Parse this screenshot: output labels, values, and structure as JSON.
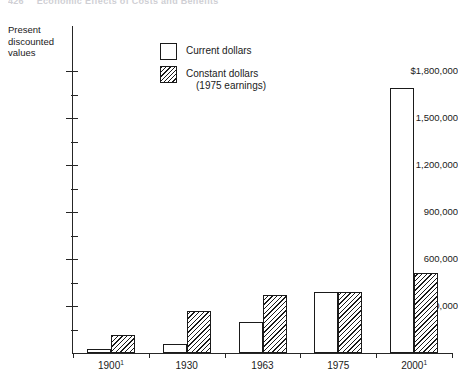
{
  "running_head": {
    "page_number": "426",
    "title": "Economic Effects of Costs and Benefits"
  },
  "chart_data": {
    "type": "bar",
    "title": "",
    "ylabel": "Present discounted values",
    "xlabel": "",
    "ylim": [
      0,
      1890000
    ],
    "grid": false,
    "legend_position": "inside-top-left",
    "y_axis_caption_lines": [
      "Present",
      "discounted",
      "values"
    ],
    "categories": [
      "1900",
      "1930",
      "1963",
      "1975",
      "2000"
    ],
    "category_labels": [
      {
        "text": "1900",
        "footnote": "1"
      },
      {
        "text": "1930",
        "footnote": ""
      },
      {
        "text": "1963",
        "footnote": ""
      },
      {
        "text": "1975",
        "footnote": ""
      },
      {
        "text": "2000",
        "footnote": "1"
      }
    ],
    "y_ticks": [
      {
        "value": 1800000,
        "label": "$1,800,000",
        "major": true
      },
      {
        "value": 1650000,
        "label": "",
        "major": false
      },
      {
        "value": 1500000,
        "label": "1,500,000",
        "major": true
      },
      {
        "value": 1350000,
        "label": "",
        "major": false
      },
      {
        "value": 1200000,
        "label": "1,200,000",
        "major": true
      },
      {
        "value": 1050000,
        "label": "",
        "major": false
      },
      {
        "value": 900000,
        "label": "900,000",
        "major": true
      },
      {
        "value": 750000,
        "label": "",
        "major": false
      },
      {
        "value": 600000,
        "label": "600,000",
        "major": true
      },
      {
        "value": 450000,
        "label": "",
        "major": false
      },
      {
        "value": 300000,
        "label": "300,000",
        "major": true
      },
      {
        "value": 150000,
        "label": "",
        "major": false
      }
    ],
    "series": [
      {
        "name": "Current dollars",
        "fill": "open",
        "values": [
          25000,
          60000,
          200000,
          390000,
          1690000
        ]
      },
      {
        "name": "Constant dollars (1975 earnings)",
        "fill": "hatched",
        "values": [
          115000,
          265000,
          370000,
          390000,
          510000
        ]
      }
    ],
    "legend": [
      {
        "label": "Current dollars",
        "sub_label": "",
        "fill": "open"
      },
      {
        "label": "Constant dollars",
        "sub_label": "(1975 earnings)",
        "fill": "hatched"
      }
    ],
    "colors": {
      "ink": "#1a1a1a",
      "axis": "#262626",
      "background": "#ffffff"
    }
  }
}
